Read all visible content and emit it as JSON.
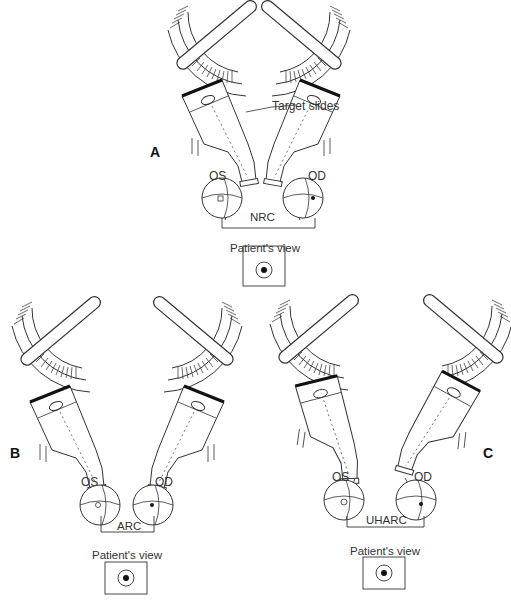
{
  "figure": {
    "panels": [
      {
        "id": "A",
        "letter": "A",
        "left_eye": "OS",
        "right_eye": "OD",
        "correspondence": "NRC",
        "annotation": "Target slides",
        "view_label": "Patient's view"
      },
      {
        "id": "B",
        "letter": "B",
        "left_eye": "OS",
        "right_eye": "OD",
        "correspondence": "ARC",
        "view_label": "Patient's view"
      },
      {
        "id": "C",
        "letter": "C",
        "left_eye": "OS",
        "right_eye": "OD",
        "correspondence": "UHARC",
        "view_label": "Patient's view"
      }
    ]
  },
  "colors": {
    "line": "#333333",
    "background": "#ffffff"
  }
}
